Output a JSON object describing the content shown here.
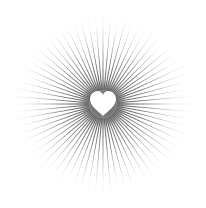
{
  "illustration": {
    "subject": "heart-sunburst",
    "center": [
      103,
      104
    ],
    "ray_count": 72,
    "inner_radius": 14,
    "outer_radius": 98,
    "ray_color": "#555555",
    "heart_color": "#ffffff",
    "halo_color": "#666666",
    "background": "#ffffff"
  }
}
